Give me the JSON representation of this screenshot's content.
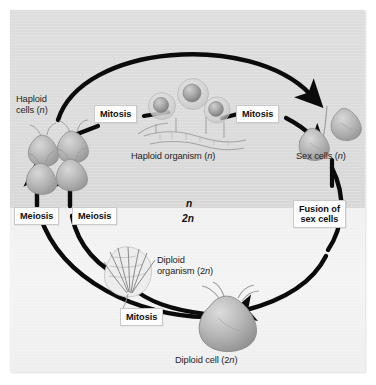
{
  "figure": {
    "panel": {
      "background_upper": "#dcdcdc",
      "background_lower": "#f2f2f2",
      "border": "#c9c9c9"
    }
  },
  "ploidy_markers": [
    {
      "id": "n",
      "text": "n"
    },
    {
      "id": "2n",
      "text": "2n"
    }
  ],
  "process_boxes": [
    {
      "id": "mitosis-haploid-cells-to-organism",
      "text": "Mitosis"
    },
    {
      "id": "mitosis-organism-to-sex-cells",
      "text": "Mitosis"
    },
    {
      "id": "meiosis-left",
      "text": "Meiosis"
    },
    {
      "id": "meiosis-right",
      "text": "Meiosis"
    },
    {
      "id": "fusion-of-sex-cells",
      "line1": "Fusion of",
      "line2": "sex cells"
    },
    {
      "id": "mitosis-diploid-cell-to-organism",
      "text": "Mitosis"
    }
  ],
  "structure_labels": [
    {
      "id": "haploid-cells",
      "line1": "Haploid",
      "line2": "cells (",
      "italic": "n",
      "line2_end": ")"
    },
    {
      "id": "haploid-organism",
      "line1": "Haploid organism (",
      "italic": "n",
      "line1_end": ")"
    },
    {
      "id": "sex-cells",
      "line1": "Sex cells (",
      "italic": "n",
      "line1_end": ")"
    },
    {
      "id": "diploid-organism",
      "line1": "Diploid",
      "line2": "organism (2",
      "italic": "n",
      "line2_end": ")"
    },
    {
      "id": "diploid-cell",
      "line1": "Diploid cell (2",
      "italic": "n",
      "line1_end": ")"
    }
  ],
  "text": {
    "haploid_cells_l1": "Haploid",
    "haploid_cells_l2_pre": "cells (",
    "haploid_cells_l2_n": "n",
    "haploid_cells_l2_post": ")",
    "haploid_organism_pre": "Haploid organism (",
    "haploid_organism_n": "n",
    "haploid_organism_post": ")",
    "sex_cells_pre": "Sex cells (",
    "sex_cells_n": "n",
    "sex_cells_post": ")",
    "diploid_organism_l1": "Diploid",
    "diploid_organism_l2_pre": "organism (2",
    "diploid_organism_l2_n": "n",
    "diploid_organism_l2_post": ")",
    "diploid_cell_pre": "Diploid cell (2",
    "diploid_cell_n": "n",
    "diploid_cell_post": ")",
    "mitosis_1": "Mitosis",
    "mitosis_2": "Mitosis",
    "mitosis_3": "Mitosis",
    "meiosis_1": "Meiosis",
    "meiosis_2": "Meiosis",
    "fusion_l1": "Fusion of",
    "fusion_l2": "sex cells",
    "ploidy_n": "n",
    "ploidy_2n": "2n"
  },
  "colors": {
    "arrow": "#0b0b0b",
    "text": "#1d1d1d",
    "box_bg": "#fdfdfd",
    "cell_fill": "#b7b7b7",
    "cell_outline": "#8f8f8f",
    "spore_fill": "#a8a8a8"
  }
}
